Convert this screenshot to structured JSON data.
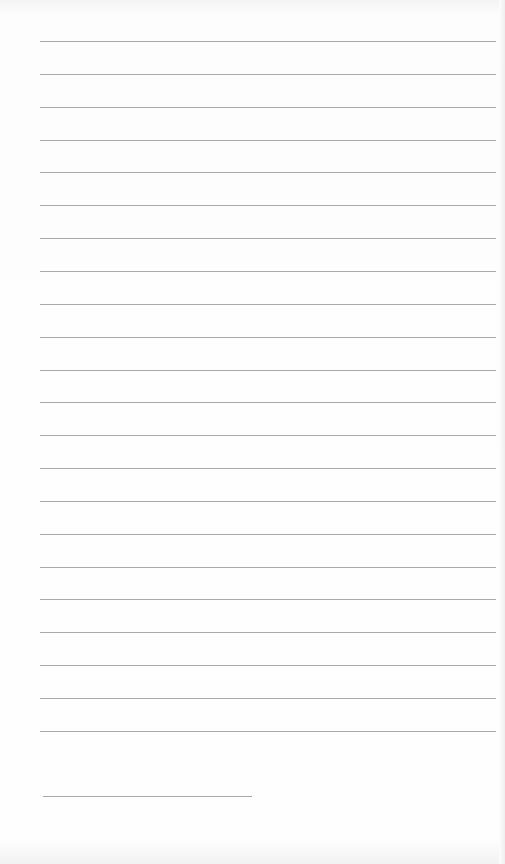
{
  "document": {
    "type": "lined-paper",
    "line_color": "#9a9a9a",
    "background_color": "#fdfdfd",
    "full_lines": {
      "count": 22,
      "left": 40,
      "right": 496,
      "first_y": 41,
      "spacing": 32.85
    },
    "short_line": {
      "left": 43,
      "right": 252,
      "y": 796
    },
    "text": ""
  }
}
